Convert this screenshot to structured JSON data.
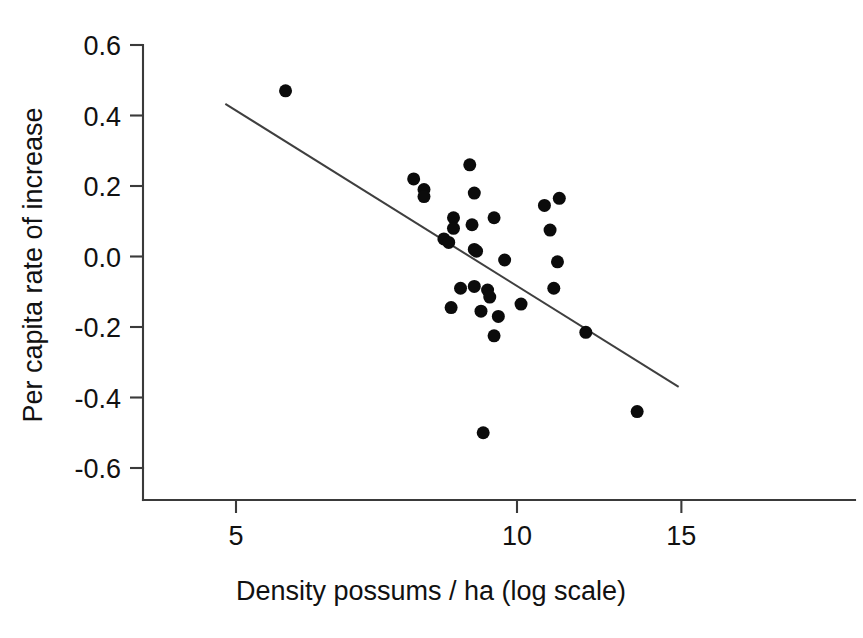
{
  "chart_data": {
    "type": "scatter",
    "title": "",
    "subtitle": "",
    "xlabel": "Density possums / ha (log scale)",
    "ylabel": "Per capita rate of increase",
    "x_scale": "log",
    "y_scale": "linear",
    "grid": false,
    "legend": "none",
    "annotations": [],
    "xlim": [
      3.6,
      19.0
    ],
    "ylim": [
      -0.66,
      0.62
    ],
    "xticks": [
      5,
      10,
      15
    ],
    "xtick_labels": [
      "5",
      "10",
      "15"
    ],
    "yticks": [
      0.6,
      0.4,
      0.2,
      0.0,
      -0.2,
      -0.4,
      -0.6
    ],
    "ytick_labels": [
      "0.6",
      "0.4",
      "0.2",
      "0.0",
      "-0.2",
      "-0.4",
      "-0.6"
    ],
    "series": [
      {
        "name": "possum populations",
        "marker": "filled-circle",
        "marker_color": "#0b0b0b",
        "marker_size": 13,
        "points": [
          {
            "x": 5.65,
            "y": 0.47
          },
          {
            "x": 7.75,
            "y": 0.22
          },
          {
            "x": 7.95,
            "y": 0.19
          },
          {
            "x": 7.95,
            "y": 0.17
          },
          {
            "x": 8.35,
            "y": 0.05
          },
          {
            "x": 8.45,
            "y": 0.04
          },
          {
            "x": 8.55,
            "y": 0.11
          },
          {
            "x": 8.55,
            "y": 0.08
          },
          {
            "x": 8.9,
            "y": 0.26
          },
          {
            "x": 9.0,
            "y": 0.18
          },
          {
            "x": 8.95,
            "y": 0.09
          },
          {
            "x": 9.45,
            "y": 0.11
          },
          {
            "x": 9.0,
            "y": 0.02
          },
          {
            "x": 9.05,
            "y": 0.015
          },
          {
            "x": 9.7,
            "y": -0.01
          },
          {
            "x": 8.7,
            "y": -0.09
          },
          {
            "x": 9.0,
            "y": -0.085
          },
          {
            "x": 9.3,
            "y": -0.095
          },
          {
            "x": 9.35,
            "y": -0.115
          },
          {
            "x": 8.5,
            "y": -0.145
          },
          {
            "x": 9.15,
            "y": -0.155
          },
          {
            "x": 9.55,
            "y": -0.17
          },
          {
            "x": 10.1,
            "y": -0.135
          },
          {
            "x": 9.45,
            "y": -0.225
          },
          {
            "x": 9.2,
            "y": -0.5
          },
          {
            "x": 10.7,
            "y": 0.145
          },
          {
            "x": 11.1,
            "y": 0.165
          },
          {
            "x": 10.85,
            "y": 0.075
          },
          {
            "x": 11.05,
            "y": -0.015
          },
          {
            "x": 10.95,
            "y": -0.09
          },
          {
            "x": 11.85,
            "y": -0.215
          },
          {
            "x": 13.45,
            "y": -0.44
          }
        ]
      }
    ],
    "fit_line": {
      "name": "linear regression (log x)",
      "color": "#3f3f3f",
      "x_start": 4.87,
      "y_start": 0.433,
      "x_end": 14.9,
      "y_end": -0.37
    }
  }
}
